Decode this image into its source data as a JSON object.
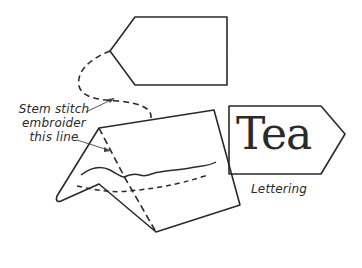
{
  "diagram": {
    "annotation": {
      "lines": [
        "Stem stitch",
        "embroider",
        "this line"
      ]
    },
    "tag_lettering": {
      "text": "Tea",
      "caption": "Lettering"
    },
    "colors": {
      "stroke": "#2a2a2a",
      "background": "#ffffff"
    }
  }
}
